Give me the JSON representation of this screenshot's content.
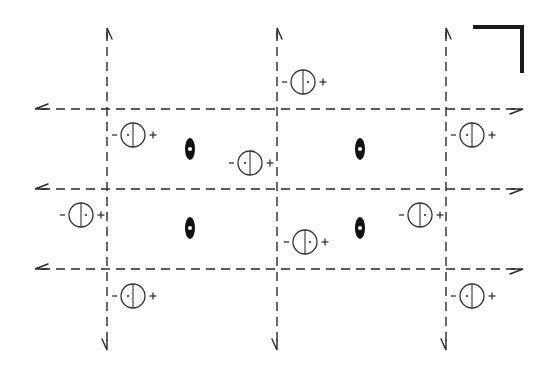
{
  "diagram": {
    "colors": {
      "line": "#2a2a2a",
      "symbol": "#333333",
      "background": "#ffffff"
    },
    "corner_mark": {
      "type": "thick-L",
      "x1": 473,
      "y": 27,
      "x2": 522,
      "y2": 73
    },
    "vertical_lines": [
      {
        "x": 107,
        "y_top": 28,
        "y_bottom": 350
      },
      {
        "x": 277,
        "y_top": 28,
        "y_bottom": 350
      },
      {
        "x": 446,
        "y_top": 28,
        "y_bottom": 350
      }
    ],
    "horizontal_lines": [
      {
        "y": 109,
        "x_left": 35,
        "x_right": 523
      },
      {
        "y": 189,
        "x_left": 35,
        "x_right": 523
      },
      {
        "y": 269,
        "x_left": 35,
        "x_right": 523
      }
    ],
    "twofold_axes": [
      {
        "x": 190,
        "y": 149
      },
      {
        "x": 360,
        "y": 149
      },
      {
        "x": 190,
        "y": 228
      },
      {
        "x": 360,
        "y": 228
      }
    ],
    "circle_symbols": [
      {
        "x": 133,
        "y": 135,
        "dot": "left",
        "minus": "−",
        "plus": "+"
      },
      {
        "x": 303,
        "y": 82,
        "dot": "right",
        "minus": "−",
        "plus": "+"
      },
      {
        "x": 472,
        "y": 135,
        "dot": "left",
        "minus": "−",
        "plus": "+"
      },
      {
        "x": 250,
        "y": 163,
        "dot": "left",
        "minus": "−",
        "plus": "+"
      },
      {
        "x": 81,
        "y": 215,
        "dot": "right",
        "minus": "−",
        "plus": "+"
      },
      {
        "x": 420,
        "y": 215,
        "dot": "right",
        "minus": "−",
        "plus": "+"
      },
      {
        "x": 305,
        "y": 242,
        "dot": "right",
        "minus": "−",
        "plus": "+"
      },
      {
        "x": 133,
        "y": 296,
        "dot": "left",
        "minus": "−",
        "plus": "+"
      },
      {
        "x": 472,
        "y": 296,
        "dot": "left",
        "minus": "−",
        "plus": "+"
      }
    ]
  }
}
